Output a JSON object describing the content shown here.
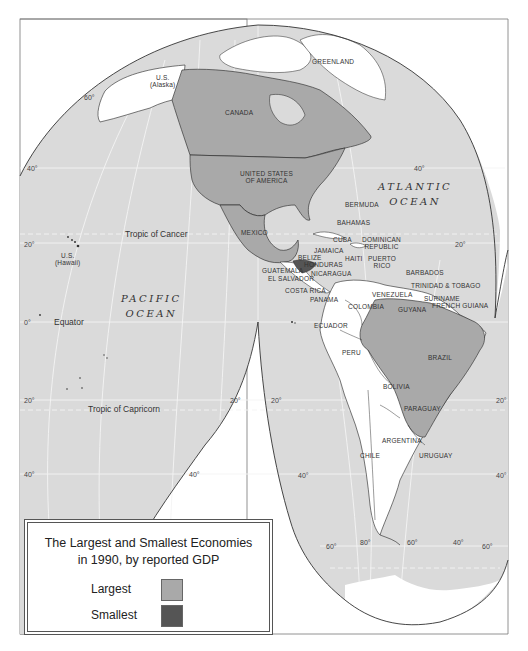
{
  "legend": {
    "title_line1": "The Largest and Smallest Economies",
    "title_line2": "in 1990, by reported GDP",
    "items": [
      {
        "label": "Largest",
        "color": "#a9a9a9"
      },
      {
        "label": "Smallest",
        "color": "#555555"
      }
    ]
  },
  "colors": {
    "ocean": "#dadada",
    "land_other": "#ffffff",
    "largest": "#a9a9a9",
    "smallest": "#555555",
    "graticule": "#f4f4f4"
  },
  "oceans": {
    "atlantic": [
      "ATLANTIC",
      "OCEAN"
    ],
    "pacific": [
      "PACIFIC",
      "OCEAN"
    ]
  },
  "reference_lines": {
    "tropic_of_cancer": "Tropic of Cancer",
    "equator": "Equator",
    "tropic_of_capricorn": "Tropic of Capricorn"
  },
  "country_labels": {
    "alaska": [
      "U.S.",
      "(Alaska)"
    ],
    "canada": "CANADA",
    "greenland": "GREENLAND",
    "usa": [
      "UNITED STATES",
      "OF AMERICA"
    ],
    "mexico": "MEXICO",
    "hawaii": [
      "U.S.",
      "(Hawaii)"
    ],
    "bermuda": "BERMUDA",
    "bahamas": "BAHAMAS",
    "cuba": "CUBA",
    "dominican_republic": [
      "DOMINICAN",
      "REPUBLIC"
    ],
    "jamaica": "JAMAICA",
    "haiti": "HAITI",
    "puerto_rico": [
      "PUERTO",
      "RICO"
    ],
    "belize": "BELIZE",
    "honduras": "HONDURAS",
    "guatemala": "GUATEMALA",
    "el_salvador": "EL SALVADOR",
    "nicaragua": "NICARAGUA",
    "costa_rica": "COSTA RICA",
    "panama": "PANAMA",
    "barbados": "BARBADOS",
    "trinidad": "TRINIDAD & TOBAGO",
    "venezuela": "VENEZUELA",
    "suriname": "SURINAME",
    "french_guiana": "FRENCH GUIANA",
    "guyana": "GUYANA",
    "colombia": "COLOMBIA",
    "ecuador": "ECUADOR",
    "peru": "PERU",
    "brazil": "BRAZIL",
    "bolivia": "BOLIVIA",
    "paraguay": "PARAGUAY",
    "argentina": "ARGENTINA",
    "chile": "CHILE",
    "uruguay": "URUGUAY"
  },
  "degree_labels": {
    "lat_60_nw": "60°",
    "lat_40_w": "40°",
    "lat_40_e": "40°",
    "lat_20_w": "20°",
    "lat_20_e": "20°",
    "lat_0": "0°",
    "lat_20s_w": "20°",
    "lat_20s_mid1": "20°",
    "lat_20s_mid2": "20°",
    "lat_20s_e": "20°",
    "lat_40s_w": "40°",
    "lat_40s_mid1": "40°",
    "lat_40s_mid2": "40°",
    "lat_40s_e": "40°",
    "lat_60s_a": "60°",
    "lon_80": "80°",
    "lon_60": "60°",
    "lon_40": "40°",
    "lat_60s_e": "60°"
  }
}
